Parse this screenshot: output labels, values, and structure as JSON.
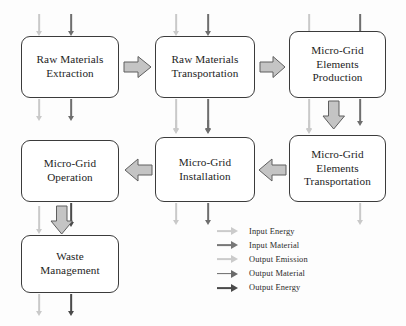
{
  "diagram": {
    "nodes": [
      {
        "id": "raw-materials-extraction",
        "lines": [
          "Raw Materials",
          "Extraction"
        ]
      },
      {
        "id": "raw-materials-transportation",
        "lines": [
          "Raw Materials",
          "Transportation"
        ]
      },
      {
        "id": "micro-grid-elements-production",
        "lines": [
          "Micro-Grid",
          "Elements",
          "Production"
        ]
      },
      {
        "id": "micro-grid-elements-transportation",
        "lines": [
          "Micro-Grid",
          "Elements",
          "Transportation"
        ]
      },
      {
        "id": "micro-grid-installation",
        "lines": [
          "Micro-Grid",
          "Installation"
        ]
      },
      {
        "id": "micro-grid-operation",
        "lines": [
          "Micro-Grid",
          "Operation"
        ]
      },
      {
        "id": "waste-management",
        "lines": [
          "Waste",
          "Management"
        ]
      }
    ],
    "flow_order": [
      "Raw Materials Extraction",
      "Raw Materials Transportation",
      "Micro-Grid Elements Production",
      "Micro-Grid Elements Transportation",
      "Micro-Grid Installation",
      "Micro-Grid Operation",
      "Waste Management"
    ]
  },
  "legend": {
    "items": [
      {
        "label": "Input Energy",
        "color": "#cbcbcb"
      },
      {
        "label": "Input Material",
        "color": "#777777"
      },
      {
        "label": "Output Emission",
        "color": "#cbcbcb"
      },
      {
        "label": "Output Material",
        "color": "#6a6a6a"
      },
      {
        "label": "Output Energy",
        "color": "#4a4a4a"
      }
    ]
  },
  "colors": {
    "box_border": "#3b3b3b",
    "box_fill": "#ffffff",
    "block_arrow_fill": "#c4c4c4",
    "block_arrow_stroke": "#5e5e5e",
    "light_flow": "#c9c9c9",
    "dark_flow": "#6e6e6e",
    "text": "#1d1d1d",
    "background": "#ffffff"
  }
}
